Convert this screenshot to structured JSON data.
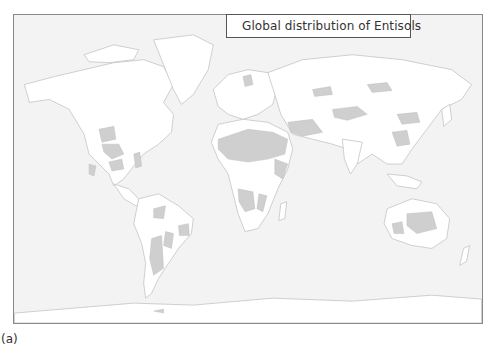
{
  "legend": {
    "label": "Global distribution of Entisols",
    "swatch_color": "#cfcfcf"
  },
  "figure_label": "(a)",
  "colors": {
    "ocean": "#f3f3f3",
    "land": "#ffffff",
    "entisols": "#cfcfcf",
    "coastline": "#bdbdbd",
    "frame": "#8a8a8a"
  }
}
